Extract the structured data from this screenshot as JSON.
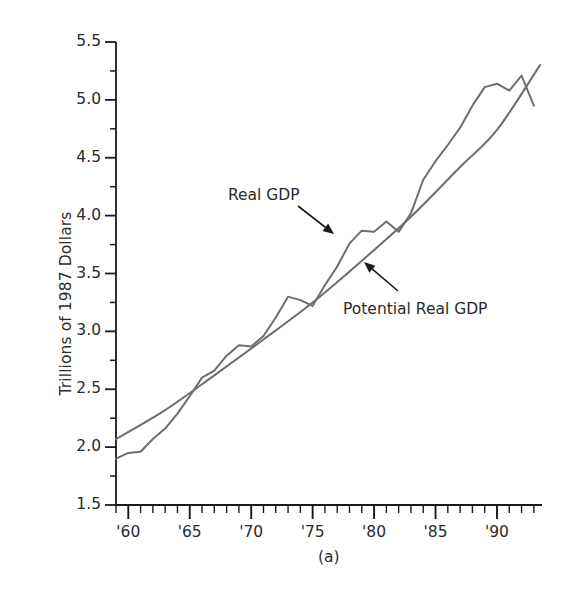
{
  "figure": {
    "panel_caption": "(a)",
    "background_color": "#ffffff",
    "axis_color": "#1a1a1a",
    "text_color": "#2b2b2b"
  },
  "axes": {
    "y": {
      "label": "Trillions of 1987 Dollars",
      "ticks": [
        "5.5",
        "5.0",
        "4.5",
        "4.0",
        "3.5",
        "3.0",
        "2.5",
        "2.0",
        "1.5"
      ],
      "min": 1.5,
      "max": 5.5,
      "minor_ticks_per_interval": 1
    },
    "x": {
      "label": "",
      "ticks": [
        "'60",
        "'65",
        "'70",
        "'75",
        "'80",
        "'85",
        "'90"
      ],
      "tick_years": [
        1960,
        1965,
        1970,
        1975,
        1980,
        1985,
        1990
      ],
      "min": 1959,
      "max": 1993.5,
      "minor_tick_step": 1
    }
  },
  "annotations": [
    {
      "name": "real-gdp",
      "text": "Real GDP",
      "x": 228,
      "y": 186,
      "arrow": {
        "x1": 298,
        "y1": 206,
        "x2": 334,
        "y2": 234
      }
    },
    {
      "name": "potential-real-gdp",
      "text": "Potential Real GDP",
      "x": 343,
      "y": 300,
      "arrow": {
        "x1": 398,
        "y1": 291,
        "x2": 364,
        "y2": 262
      }
    }
  ],
  "chart_data": {
    "type": "line",
    "title": "",
    "subtitle": "",
    "xlabel": "",
    "ylabel": "Trillions of 1987 Dollars",
    "xlim": [
      1959,
      1993.5
    ],
    "ylim": [
      1.5,
      5.5
    ],
    "grid": false,
    "legend": "none",
    "line_color": "#6e6e6e",
    "line_width": 2.0,
    "series": [
      {
        "name": "Real GDP",
        "color": "#6e6e6e",
        "x": [
          1959,
          1960,
          1961,
          1962,
          1963,
          1964,
          1965,
          1966,
          1967,
          1968,
          1969,
          1970,
          1971,
          1972,
          1973,
          1974,
          1975,
          1976,
          1977,
          1978,
          1979,
          1980,
          1981,
          1982,
          1983,
          1984,
          1985,
          1986,
          1987,
          1988,
          1989,
          1990,
          1991,
          1992,
          1993
        ],
        "values": [
          1.9,
          1.95,
          1.96,
          2.07,
          2.16,
          2.29,
          2.44,
          2.6,
          2.66,
          2.79,
          2.88,
          2.87,
          2.96,
          3.12,
          3.3,
          3.27,
          3.22,
          3.4,
          3.56,
          3.76,
          3.87,
          3.86,
          3.95,
          3.86,
          4.02,
          4.31,
          4.47,
          4.61,
          4.76,
          4.95,
          5.11,
          5.14,
          5.08,
          5.21,
          4.95
        ]
      },
      {
        "name": "Potential Real GDP",
        "color": "#6e6e6e",
        "x": [
          1959,
          1963,
          1967,
          1971,
          1975,
          1979,
          1983,
          1987,
          1990,
          1993.5
        ],
        "values": [
          2.07,
          2.32,
          2.62,
          2.93,
          3.25,
          3.61,
          3.99,
          4.42,
          4.74,
          5.3
        ]
      }
    ]
  }
}
